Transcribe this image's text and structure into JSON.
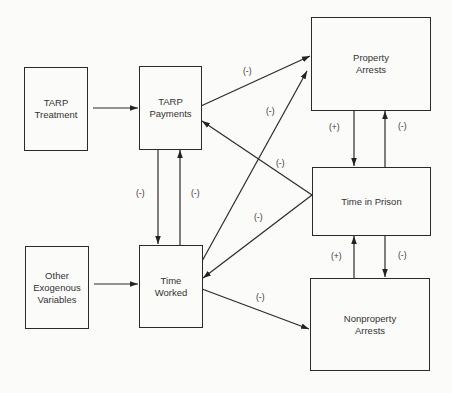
{
  "diagram": {
    "nodes": [
      {
        "id": "tarp_treatment",
        "lines": [
          "TARP",
          "Treatment"
        ]
      },
      {
        "id": "tarp_payments",
        "lines": [
          "TARP",
          "Payments"
        ]
      },
      {
        "id": "property_arrests",
        "lines": [
          "Property",
          "Arrests"
        ]
      },
      {
        "id": "time_in_prison",
        "lines": [
          "Time in Prison"
        ]
      },
      {
        "id": "other_exogenous",
        "lines": [
          "Other",
          "Exogenous",
          "Variables"
        ]
      },
      {
        "id": "time_worked",
        "lines": [
          "Time",
          "Worked"
        ]
      },
      {
        "id": "nonproperty_arrests",
        "lines": [
          "Nonproperty",
          "Arrests"
        ]
      }
    ],
    "edges": [
      {
        "from": "TARP Treatment",
        "to": "TARP Payments",
        "sign": ""
      },
      {
        "from": "Other Exogenous Variables",
        "to": "Time Worked",
        "sign": ""
      },
      {
        "from": "TARP Payments",
        "to": "Time Worked",
        "sign": "(-)"
      },
      {
        "from": "Time Worked",
        "to": "TARP Payments",
        "sign": "(-)"
      },
      {
        "from": "TARP Payments",
        "to": "Property Arrests",
        "sign": "(-)"
      },
      {
        "from": "Time Worked",
        "to": "Property Arrests",
        "sign": "(-)"
      },
      {
        "from": "Time in Prison",
        "to": "TARP Payments",
        "sign": "(-)"
      },
      {
        "from": "Time in Prison",
        "to": "Time Worked",
        "sign": "(-)"
      },
      {
        "from": "Time Worked",
        "to": "Nonproperty Arrests",
        "sign": "(-)"
      },
      {
        "from": "Property Arrests",
        "to": "Time in Prison",
        "sign": "(+)"
      },
      {
        "from": "Time in Prison",
        "to": "Property Arrests",
        "sign": "(-)"
      },
      {
        "from": "Nonproperty Arrests",
        "to": "Time in Prison",
        "sign": "(+)"
      },
      {
        "from": "Time in Prison",
        "to": "Nonproperty Arrests",
        "sign": "(-)"
      }
    ],
    "signs": {
      "payments_to_worked": "(-)",
      "worked_to_payments": "(-)",
      "payments_to_property": "(-)",
      "worked_to_property": "(-)",
      "prison_to_payments": "(-)",
      "prison_to_worked": "(-)",
      "worked_to_nonproperty": "(-)",
      "property_to_prison": "(+)",
      "prison_to_property": "(-)",
      "nonproperty_to_prison": "(+)",
      "prison_to_nonproperty": "(-)"
    }
  }
}
